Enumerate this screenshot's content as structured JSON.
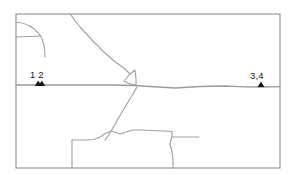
{
  "figure": {
    "name": "site-location-map",
    "type": "line-map",
    "background_color": "#ffffff",
    "border_color": "#8f8f8f",
    "road_color": "#a2a2a2",
    "marker_color": "#141414"
  },
  "frame": {
    "x": 16,
    "y": 14,
    "width": 264,
    "height": 154
  },
  "sites": [
    {
      "id": "site-1-2",
      "label": "1 2",
      "label_x": 30,
      "label_y": 78,
      "marker_x": 40,
      "marker_y": 86,
      "marker_count": 2
    },
    {
      "id": "site-3-4",
      "label": "3,4",
      "label_x": 250,
      "label_y": 79,
      "marker_x": 261,
      "marker_y": 87,
      "marker_count": 1
    }
  ],
  "roads": [
    {
      "id": "main-highway-east-west",
      "kind": "major",
      "path": "M 16 85 L 60 85 L 110 85 L 135 85.5 L 150 86.5 L 175 88 L 200 86.5 L 225 86 L 245 86.8 L 261 87 L 280 86.6"
    },
    {
      "id": "northwest-curve",
      "kind": "minor",
      "path": "M 16 22 C 26 23 34 27 40 35 C 44 41 45 49 45 57"
    },
    {
      "id": "northwest-spur",
      "kind": "minor",
      "path": "M 16 37 L 30 36.5 L 41 36"
    },
    {
      "id": "north-diagonal-to-junction",
      "kind": "minor",
      "path": "M 70 14 L 80 27 L 92 40 L 104 52 L 114 61 L 124 68 L 130 74"
    },
    {
      "id": "junction-triangle-loop",
      "kind": "minor",
      "path": "M 130 74 L 135 70 L 136 79 L 136 85 L 130 84 L 124 81 Z"
    },
    {
      "id": "junction-southwest-diagonal",
      "kind": "minor",
      "path": "M 137 87 L 130 99 L 122 112 L 114 126 L 108 136 L 105 140"
    },
    {
      "id": "lower-west-vertical",
      "kind": "minor",
      "path": "M 72 140 L 72 152 L 72 168"
    },
    {
      "id": "lower-jagged-road",
      "kind": "minor",
      "path": "M 72 140 L 86 140 L 94 139.5 L 100 137 L 106 133 L 112 131 L 117 133 L 121 134 L 126 132 L 133 130 L 142 130 L 152 130.5 L 163 131 L 172 131.5"
    },
    {
      "id": "lower-east-vertical",
      "kind": "minor",
      "path": "M 172 131.5 L 172 136 L 170 144 L 172 152 L 173 160 L 173 168"
    },
    {
      "id": "east-stub",
      "kind": "minor",
      "path": "M 172 137 L 186 137 L 199 137"
    }
  ]
}
